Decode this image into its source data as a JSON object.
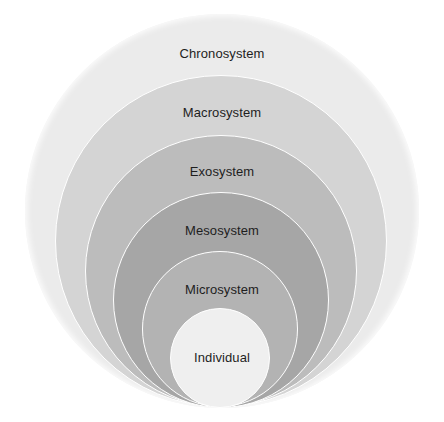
{
  "diagram": {
    "type": "nested-circles",
    "title": "",
    "layers": [
      {
        "label": "Chronosystem",
        "color": "#ebebeb",
        "cx": 222,
        "cy": 211,
        "r": 197,
        "label_y": 54
      },
      {
        "label": "Macrosystem",
        "color": "#d4d4d4",
        "cx": 221,
        "cy": 241,
        "r": 166,
        "label_y": 113
      },
      {
        "label": "Exosystem",
        "color": "#bcbcbc",
        "cx": 221,
        "cy": 271,
        "r": 136,
        "label_y": 172
      },
      {
        "label": "Mesosystem",
        "color": "#a6a6a6",
        "cx": 221,
        "cy": 300,
        "r": 108,
        "label_y": 231
      },
      {
        "label": "Microsystem",
        "color": "#b3b3b3",
        "cx": 220,
        "cy": 329,
        "r": 78,
        "label_y": 290
      },
      {
        "label": "Individual",
        "color": "#efefef",
        "cx": 220,
        "cy": 358,
        "r": 50,
        "label_y": 358
      }
    ]
  }
}
